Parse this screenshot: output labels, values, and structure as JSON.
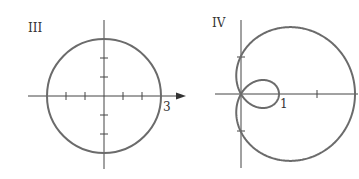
{
  "panels": [
    {
      "label": "III",
      "curve": "circle r = 3",
      "axis_label": "3",
      "colors": {
        "curve": "#6b6b6b",
        "axis": "#444444"
      }
    },
    {
      "label": "IV",
      "curve": "limacon r = 1 + 2cos(theta)",
      "axis_label": "1",
      "colors": {
        "curve": "#6b6b6b",
        "axis": "#444444"
      }
    }
  ],
  "chart_data": [
    {
      "type": "line",
      "title": "III",
      "description": "Polar graph: circle of radius 3 centered at origin",
      "x_tick_labels": [
        "3"
      ],
      "x_ticks": [
        -3,
        -2,
        -1,
        1,
        2,
        3
      ],
      "y_ticks": [
        -3,
        -2,
        -1,
        1,
        2,
        3
      ],
      "xlim": [
        -4,
        4.5
      ],
      "ylim": [
        -3.7,
        3.7
      ]
    },
    {
      "type": "line",
      "title": "IV",
      "description": "Polar graph: limacon with inner loop, r = 1 + 2cos(theta); outer loop reaches x = 3, inner loop reaches x = 1, crosses y-axis at y = ±1",
      "x_tick_labels": [
        "1"
      ],
      "x_ticks": [
        1,
        2,
        3
      ],
      "y_ticks": [
        -1,
        1
      ],
      "xlim": [
        -0.3,
        3.1
      ],
      "ylim": [
        -2.3,
        2.3
      ]
    }
  ]
}
